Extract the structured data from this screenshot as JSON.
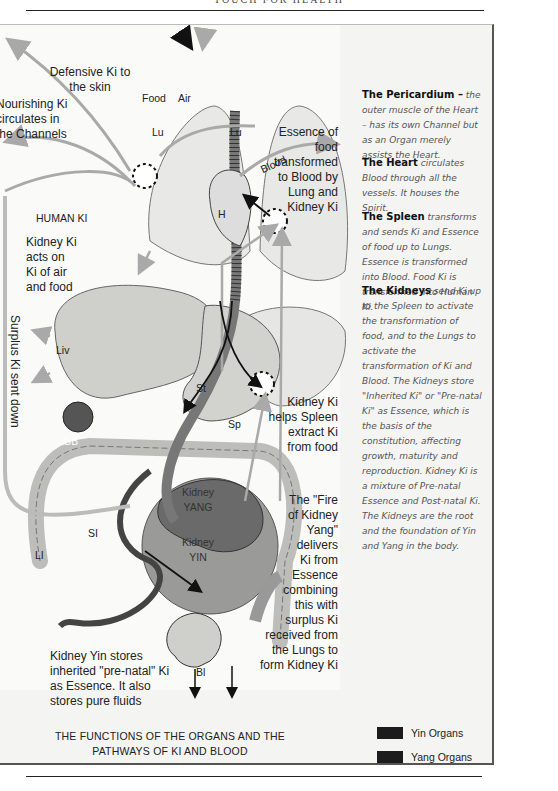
{
  "header": {
    "running_head": "TOUCH FOR HEALTH"
  },
  "diagram": {
    "title_line1": "THE FUNCTIONS OF THE ORGANS AND THE",
    "title_line2": "PATHWAYS OF KI AND BLOOD",
    "inputs": {
      "food": "Food",
      "air": "Air"
    },
    "organ_labels": {
      "lung_left": "Lu",
      "lung_right": "Lu",
      "heart": "H",
      "liver": "Liv",
      "stomach": "St",
      "spleen": "Sp",
      "gall_bladder": "GB",
      "small_intestine": "SI",
      "large_intestine": "LI",
      "bladder": "Bl",
      "kidney_yang_1": "Kidney",
      "kidney_yang_2": "YANG",
      "kidney_yin_1": "Kidney",
      "kidney_yin_2": "YIN",
      "human_ki": "HUMAN KI",
      "blood": "Blood"
    },
    "annotations": {
      "defensive_ki": [
        "Defensive Ki to",
        "the skin"
      ],
      "nourishing_ki": [
        "Nourishing Ki",
        "circulates in",
        "the Channels"
      ],
      "kidney_ki_acts": [
        "Kidney Ki",
        "acts on",
        "Ki of air",
        "and food"
      ],
      "surplus_ki": "Surplus Ki sent down",
      "essence_food": [
        "Essence of",
        "food",
        "transformed",
        "to Blood by",
        "Lung and",
        "Kidney Ki"
      ],
      "kidney_helps_spleen": [
        "Kidney Ki",
        "helps Spleen",
        "extract Ki",
        "from food"
      ],
      "fire_kidney_yang": [
        "The \"Fire",
        "of Kidney",
        "Yang\"",
        "delivers",
        "Ki from",
        "Essence",
        "combining",
        "this with",
        "surplus Ki",
        "received from",
        "the Lungs to",
        "form Kidney Ki"
      ],
      "kidney_yin_stores": [
        "Kidney Yin stores",
        "inherited \"pre-natal\" Ki",
        "as Essence. It also",
        "stores pure fluids"
      ]
    },
    "sidebar": [
      {
        "term": "The Pericardium –",
        "text": " the outer muscle of the Heart – has its own Channel but as an Organ merely assists the Heart."
      },
      {
        "term": "The Heart",
        "text": " circulates Blood through all the vessels. It houses the Spirit."
      },
      {
        "term": "The Spleen",
        "text": " transforms and sends Ki and Essence of food up to Lungs. Essence is transformed into Blood. Food Ki is transformed into Human Ki."
      },
      {
        "term": "The Kidneys",
        "text": " send Ki up to the Spleen to activate the transformation of food, and to the Lungs to activate the transformation of Ki and Blood. The Kidneys store \"Inherited Ki\" or \"Pre-natal Ki\" as Essence, which is the basis of the constitution, affecting growth, maturity and reproduction. Kidney Ki is a mixture of Pre-natal Essence and Post-natal Ki. The Kidneys are the root and the foundation of Yin and Yang in the body."
      }
    ],
    "legend": [
      {
        "label": "Yin Organs",
        "color": "#1c1c1c"
      },
      {
        "label": "Yang Organs",
        "color": "#1c1c1c"
      }
    ],
    "colors": {
      "arrow_gray": "#a9a9a9",
      "arrow_dark": "#111111",
      "organ_fill": "#d9d9d6",
      "kidney_dark": "#6a6a6a",
      "kidney_light": "#9a9a98"
    }
  }
}
